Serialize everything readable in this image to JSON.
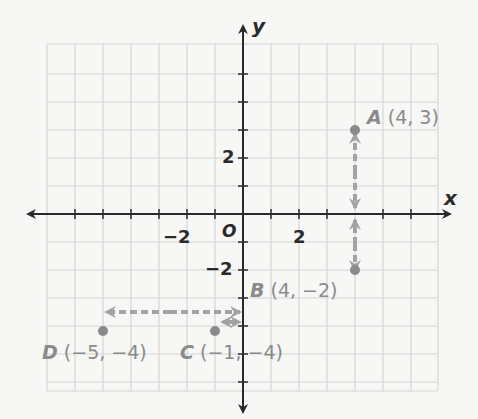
{
  "axes": {
    "x_label": "x",
    "y_label": "y",
    "origin_label": "O",
    "x_ticks": [
      {
        "value": -2,
        "label": "−2"
      },
      {
        "value": 2,
        "label": "2"
      }
    ],
    "y_ticks": [
      {
        "value": 2,
        "label": "2"
      },
      {
        "value": -2,
        "label": "−2"
      }
    ]
  },
  "points": [
    {
      "name": "A",
      "coords": "(4, 3)",
      "x": 4,
      "y": 3
    },
    {
      "name": "B",
      "coords": "(4, −2)",
      "x": 4,
      "y": -2
    },
    {
      "name": "C",
      "coords": "(−1, −4)",
      "x": -1,
      "y": -4
    },
    {
      "name": "D",
      "coords": "(−5, −4)",
      "x": -5,
      "y": -4
    }
  ],
  "colors": {
    "grid": "#d6d6d6",
    "axis": "#2a2a2a",
    "point": "#8a8a8a",
    "arrow": "#a3a3a3",
    "label": "#8a8a8a"
  }
}
